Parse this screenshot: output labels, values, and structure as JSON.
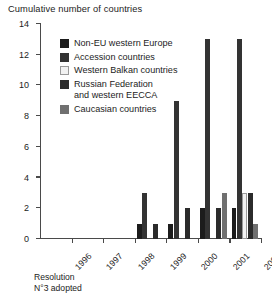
{
  "chart_data": {
    "type": "bar",
    "title": "Cumulative number of countries",
    "xlabel": "",
    "ylabel": "",
    "grid": false,
    "legend_position": "upper-left-inside",
    "ylim": [
      0,
      14
    ],
    "yticks": [
      0,
      2,
      4,
      6,
      8,
      10,
      12,
      14
    ],
    "categories": [
      "1996",
      "1997",
      "1998",
      "1999",
      "2000",
      "2001",
      "2002"
    ],
    "series": [
      {
        "name": "Non-EU western Europe",
        "color": "#1c1c1c",
        "values": [
          0,
          0,
          0,
          1,
          1,
          2,
          2
        ]
      },
      {
        "name": "Accession countries",
        "color": "#333333",
        "values": [
          0,
          0,
          0,
          3,
          9,
          13,
          13
        ]
      },
      {
        "name": "Western Balkan countries",
        "color": "#f2f2f2",
        "values": [
          0,
          0,
          0,
          0,
          0,
          0,
          3
        ]
      },
      {
        "name": "Russian Federation\nand western EECCA",
        "color": "#2b2b2b",
        "values": [
          0,
          0,
          0,
          1,
          2,
          2,
          3
        ]
      },
      {
        "name": "Caucasian countries",
        "color": "#707070",
        "values": [
          0,
          0,
          0,
          0,
          0,
          3,
          1
        ]
      }
    ],
    "annotations": [
      {
        "text": "Resolution\nN°3 adopted",
        "at_category": "1996"
      }
    ]
  },
  "colors": {
    "axis": "#4a4a4a",
    "text": "#1c1c1c",
    "background": "#ffffff",
    "swatch_border": "#9a9a9a"
  }
}
